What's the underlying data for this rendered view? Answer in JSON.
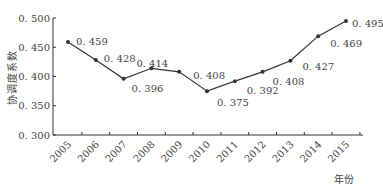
{
  "chart_data": {
    "type": "line",
    "title": "",
    "xlabel": "年份",
    "ylabel": "协调度系数",
    "categories": [
      "2005",
      "2006",
      "2007",
      "2008",
      "2009",
      "2010",
      "2011",
      "2012",
      "2013",
      "2014",
      "2015"
    ],
    "series": [
      {
        "name": "协调度系数",
        "values": [
          0.459,
          0.428,
          0.396,
          0.414,
          0.408,
          0.375,
          0.392,
          0.408,
          0.427,
          0.469,
          0.495
        ]
      }
    ],
    "data_labels": [
      "0. 459",
      "0. 428",
      "0. 396",
      "0. 414",
      "0. 408",
      "0. 375",
      "0. 392",
      "0. 408",
      "0. 427",
      "0. 469",
      "0. 495"
    ],
    "yticks": [
      "0. 300",
      "0. 350",
      "0. 400",
      "0. 450",
      "0. 500"
    ],
    "ylim": [
      0.3,
      0.5
    ],
    "grid": false,
    "legend": "none",
    "line_color": "#333333"
  }
}
